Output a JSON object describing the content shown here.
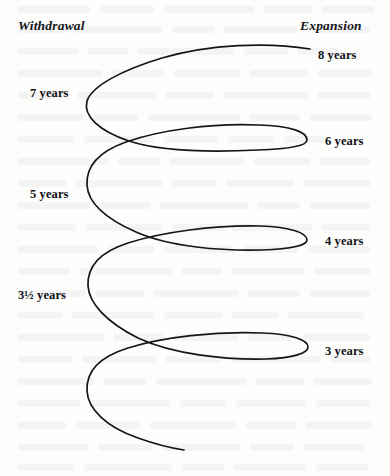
{
  "figure": {
    "kind": "spiral-cycle-diagram",
    "background_color": "#fdfdfc",
    "stroke_color": "#14141a",
    "width": 390,
    "height": 476
  },
  "axis_labels": {
    "left": "Withdrawal",
    "right": "Expansion"
  },
  "year_labels": [
    {
      "id": "y8",
      "text": "8 years",
      "side": "right",
      "x": 318,
      "y": 48
    },
    {
      "id": "y7",
      "text": "7 years",
      "side": "left",
      "x": 30,
      "y": 86
    },
    {
      "id": "y6",
      "text": "6 years",
      "side": "right",
      "x": 325,
      "y": 134
    },
    {
      "id": "y5",
      "text": "5 years",
      "side": "left",
      "x": 30,
      "y": 187
    },
    {
      "id": "y4",
      "text": "4 years",
      "side": "right",
      "x": 325,
      "y": 234
    },
    {
      "id": "y3half",
      "text": "3½ years",
      "side": "left",
      "x": 18,
      "y": 288
    },
    {
      "id": "y3",
      "text": "3 years",
      "side": "right",
      "x": 325,
      "y": 344
    }
  ],
  "curve": {
    "description": "continuous open spiral running from upper right to lower middle, alternating left (withdrawal) and right (expansion) turning points",
    "path": "M 310 49 C 268 42 210 44 162 58 C 122 70 92 86 87 101 C 83 116 99 131 129 141 C 162 152 216 152 258 150 C 290 149 307 146 307 140 C 307 132 292 126 258 125 C 212 123 160 130 126 142 C 98 152 86 167 87 185 C 88 202 104 218 136 232 C 170 247 222 251 262 250 C 292 249 307 245 307 240 C 307 233 291 227 260 226 C 214 225 162 232 128 243 C 100 252 87 267 88 286 C 89 303 106 322 138 338 C 172 354 224 360 266 359 C 294 358 308 353 308 347 C 308 340 292 334 262 333 C 216 331 163 337 128 348 C 99 357 86 372 87 391 C 88 409 106 427 138 438 C 155 444 170 448 184 450"
  },
  "bleed_lines": [
    {
      "x": 18,
      "y": 6,
      "w": 72
    },
    {
      "x": 100,
      "y": 6,
      "w": 54
    },
    {
      "x": 164,
      "y": 6,
      "w": 90
    },
    {
      "x": 264,
      "y": 6,
      "w": 48
    },
    {
      "x": 322,
      "y": 6,
      "w": 52
    },
    {
      "x": 18,
      "y": 26,
      "w": 46
    },
    {
      "x": 74,
      "y": 26,
      "w": 88
    },
    {
      "x": 172,
      "y": 26,
      "w": 42
    },
    {
      "x": 224,
      "y": 26,
      "w": 74
    },
    {
      "x": 308,
      "y": 26,
      "w": 62
    },
    {
      "x": 18,
      "y": 48,
      "w": 60
    },
    {
      "x": 88,
      "y": 48,
      "w": 40
    },
    {
      "x": 138,
      "y": 48,
      "w": 96
    },
    {
      "x": 244,
      "y": 48,
      "w": 44
    },
    {
      "x": 298,
      "y": 48,
      "w": 40
    },
    {
      "x": 18,
      "y": 70,
      "w": 84
    },
    {
      "x": 112,
      "y": 70,
      "w": 52
    },
    {
      "x": 174,
      "y": 70,
      "w": 66
    },
    {
      "x": 250,
      "y": 70,
      "w": 58
    },
    {
      "x": 318,
      "y": 70,
      "w": 54
    },
    {
      "x": 18,
      "y": 92,
      "w": 50
    },
    {
      "x": 78,
      "y": 92,
      "w": 78
    },
    {
      "x": 166,
      "y": 92,
      "w": 48
    },
    {
      "x": 224,
      "y": 92,
      "w": 84
    },
    {
      "x": 318,
      "y": 92,
      "w": 52
    },
    {
      "x": 18,
      "y": 114,
      "w": 66
    },
    {
      "x": 94,
      "y": 114,
      "w": 44
    },
    {
      "x": 148,
      "y": 114,
      "w": 92
    },
    {
      "x": 250,
      "y": 114,
      "w": 50
    },
    {
      "x": 310,
      "y": 114,
      "w": 62
    },
    {
      "x": 18,
      "y": 136,
      "w": 56
    },
    {
      "x": 84,
      "y": 136,
      "w": 70
    },
    {
      "x": 164,
      "y": 136,
      "w": 54
    },
    {
      "x": 228,
      "y": 136,
      "w": 46
    },
    {
      "x": 284,
      "y": 136,
      "w": 40
    },
    {
      "x": 18,
      "y": 158,
      "w": 90
    },
    {
      "x": 118,
      "y": 158,
      "w": 42
    },
    {
      "x": 170,
      "y": 158,
      "w": 74
    },
    {
      "x": 254,
      "y": 158,
      "w": 56
    },
    {
      "x": 320,
      "y": 158,
      "w": 50
    },
    {
      "x": 18,
      "y": 180,
      "w": 48
    },
    {
      "x": 76,
      "y": 180,
      "w": 86
    },
    {
      "x": 172,
      "y": 180,
      "w": 44
    },
    {
      "x": 226,
      "y": 180,
      "w": 68
    },
    {
      "x": 304,
      "y": 180,
      "w": 66
    },
    {
      "x": 18,
      "y": 202,
      "w": 72
    },
    {
      "x": 100,
      "y": 202,
      "w": 50
    },
    {
      "x": 160,
      "y": 202,
      "w": 88
    },
    {
      "x": 258,
      "y": 202,
      "w": 42
    },
    {
      "x": 310,
      "y": 202,
      "w": 60
    },
    {
      "x": 18,
      "y": 224,
      "w": 58
    },
    {
      "x": 86,
      "y": 224,
      "w": 76
    },
    {
      "x": 172,
      "y": 224,
      "w": 50
    },
    {
      "x": 232,
      "y": 224,
      "w": 80
    },
    {
      "x": 322,
      "y": 224,
      "w": 48
    },
    {
      "x": 18,
      "y": 246,
      "w": 80
    },
    {
      "x": 108,
      "y": 246,
      "w": 46
    },
    {
      "x": 164,
      "y": 246,
      "w": 70
    },
    {
      "x": 244,
      "y": 246,
      "w": 54
    },
    {
      "x": 308,
      "y": 246,
      "w": 62
    },
    {
      "x": 18,
      "y": 268,
      "w": 52
    },
    {
      "x": 80,
      "y": 268,
      "w": 92
    },
    {
      "x": 182,
      "y": 268,
      "w": 40
    },
    {
      "x": 232,
      "y": 268,
      "w": 72
    },
    {
      "x": 314,
      "y": 268,
      "w": 56
    },
    {
      "x": 18,
      "y": 290,
      "w": 68
    },
    {
      "x": 96,
      "y": 290,
      "w": 48
    },
    {
      "x": 154,
      "y": 290,
      "w": 84
    },
    {
      "x": 248,
      "y": 290,
      "w": 52
    },
    {
      "x": 310,
      "y": 290,
      "w": 60
    },
    {
      "x": 18,
      "y": 312,
      "w": 44
    },
    {
      "x": 72,
      "y": 312,
      "w": 82
    },
    {
      "x": 164,
      "y": 312,
      "w": 58
    },
    {
      "x": 232,
      "y": 312,
      "w": 46
    },
    {
      "x": 288,
      "y": 312,
      "w": 76
    },
    {
      "x": 18,
      "y": 334,
      "w": 86
    },
    {
      "x": 114,
      "y": 334,
      "w": 50
    },
    {
      "x": 174,
      "y": 334,
      "w": 64
    },
    {
      "x": 248,
      "y": 334,
      "w": 44
    },
    {
      "x": 302,
      "y": 334,
      "w": 68
    },
    {
      "x": 18,
      "y": 356,
      "w": 54
    },
    {
      "x": 82,
      "y": 356,
      "w": 74
    },
    {
      "x": 166,
      "y": 356,
      "w": 56
    },
    {
      "x": 232,
      "y": 356,
      "w": 88
    },
    {
      "x": 330,
      "y": 356,
      "w": 40
    },
    {
      "x": 18,
      "y": 378,
      "w": 76
    },
    {
      "x": 104,
      "y": 378,
      "w": 42
    },
    {
      "x": 156,
      "y": 378,
      "w": 90
    },
    {
      "x": 256,
      "y": 378,
      "w": 48
    },
    {
      "x": 314,
      "y": 378,
      "w": 58
    },
    {
      "x": 18,
      "y": 400,
      "w": 62
    },
    {
      "x": 90,
      "y": 400,
      "w": 80
    },
    {
      "x": 180,
      "y": 400,
      "w": 46
    },
    {
      "x": 236,
      "y": 400,
      "w": 70
    },
    {
      "x": 316,
      "y": 400,
      "w": 54
    },
    {
      "x": 18,
      "y": 422,
      "w": 48
    },
    {
      "x": 76,
      "y": 422,
      "w": 64
    },
    {
      "x": 150,
      "y": 422,
      "w": 86
    },
    {
      "x": 246,
      "y": 422,
      "w": 50
    },
    {
      "x": 306,
      "y": 422,
      "w": 66
    },
    {
      "x": 18,
      "y": 444,
      "w": 70
    },
    {
      "x": 98,
      "y": 444,
      "w": 54
    },
    {
      "x": 162,
      "y": 444,
      "w": 78
    },
    {
      "x": 250,
      "y": 444,
      "w": 44
    },
    {
      "x": 304,
      "y": 444,
      "w": 60
    },
    {
      "x": 18,
      "y": 464,
      "w": 56
    },
    {
      "x": 84,
      "y": 464,
      "w": 88
    },
    {
      "x": 182,
      "y": 464,
      "w": 42
    },
    {
      "x": 234,
      "y": 464,
      "w": 72
    },
    {
      "x": 316,
      "y": 464,
      "w": 52
    }
  ]
}
